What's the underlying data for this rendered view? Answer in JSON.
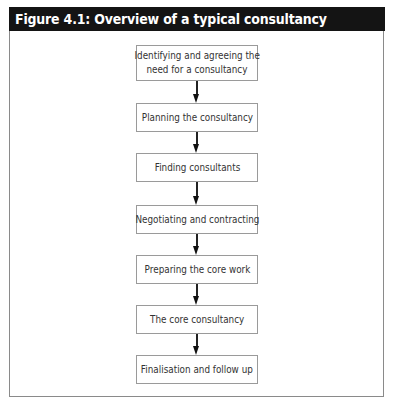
{
  "figure": {
    "title": "Figure 4.1: Overview of a typical consultancy",
    "title_bar_color": "#141414",
    "title_text_color": "#ffffff",
    "box_border_color": "#9a9a9a",
    "arrow_color": "#222222"
  },
  "flow": {
    "steps": [
      {
        "line1": "Identifying and agreeing the",
        "line2": "need for a consultancy"
      },
      {
        "label": "Planning the consultancy"
      },
      {
        "label": "Finding consultants"
      },
      {
        "label": "Negotiating and contracting"
      },
      {
        "label": "Preparing the core work"
      },
      {
        "label": "The core consultancy"
      },
      {
        "label": "Finalisation and follow up"
      }
    ],
    "connectors": [
      {
        "from": 0,
        "to": 1
      },
      {
        "from": 1,
        "to": 2
      },
      {
        "from": 2,
        "to": 3
      },
      {
        "from": 3,
        "to": 4
      },
      {
        "from": 4,
        "to": 5
      },
      {
        "from": 5,
        "to": 6
      }
    ]
  }
}
